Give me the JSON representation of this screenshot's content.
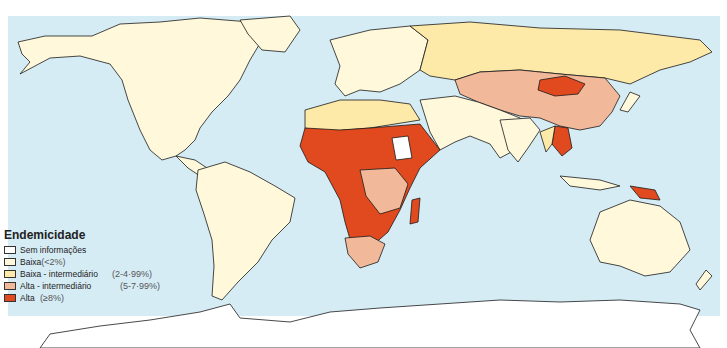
{
  "map": {
    "ocean_color": "#d6ecf5",
    "border_color": "#1a1a1a",
    "colors": {
      "no_info": "#ffffff",
      "low": "#fff8da",
      "low_intermediate": "#fde9a8",
      "high_intermediate": "#f2b89a",
      "high": "#e04a1e"
    }
  },
  "legend": {
    "title": "Endemicidade",
    "items": [
      {
        "label": "Sem informações",
        "range": "",
        "color": "#ffffff"
      },
      {
        "label": "Baixa",
        "range": "(<2%)",
        "color": "#fff8da"
      },
      {
        "label": "Baixa - intermediário",
        "range": "(2-4·99%)",
        "color": "#fde9a8"
      },
      {
        "label": "Alta - intermediário",
        "range": "(5-7·99%)",
        "color": "#f2b89a"
      },
      {
        "label": "Alta",
        "range": "(≥8%)",
        "color": "#e04a1e"
      }
    ]
  }
}
